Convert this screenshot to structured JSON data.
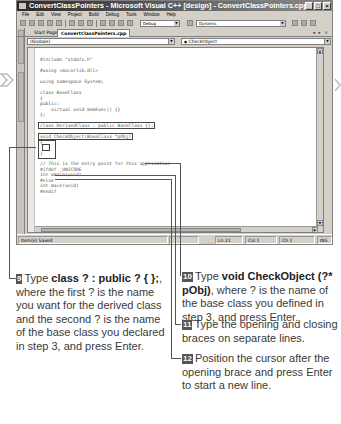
{
  "window": {
    "title": "ConvertClassPointers - Microsoft Visual C++ [design] - ConvertClassPointers.cpp",
    "controls": [
      "minimize",
      "maximize",
      "close"
    ]
  },
  "menubar": {
    "items": [
      "File",
      "Edit",
      "View",
      "Project",
      "Build",
      "Debug",
      "Tools",
      "Window",
      "Help"
    ]
  },
  "toolbar": {
    "config_value": "Debug",
    "find_value": "Dynamic"
  },
  "tabs": {
    "items": [
      {
        "label": "Start Page",
        "active": false
      },
      {
        "label": "ConvertClassPointers.cpp",
        "active": true
      }
    ],
    "controls": "◂ ▸ ×"
  },
  "side_panels": [
    "Server Explorer",
    "Solution Explorer"
  ],
  "navigation": {
    "scope_combo": "(Globals)",
    "member_combo": "CheckObject"
  },
  "code": {
    "lines": [
      {
        "text": "#include \"stdafx.h\"",
        "y": 9
      },
      {
        "text": "#using <mscorlib.dll>",
        "y": 20
      },
      {
        "text": "using namespace System;",
        "y": 31
      },
      {
        "text": "class BaseClass",
        "y": 42
      },
      {
        "text": "{",
        "y": 47.5
      },
      {
        "text": "public:",
        "y": 53
      },
      {
        "text": "    virtual void memFunc() {}",
        "y": 58.5
      },
      {
        "text": "};",
        "y": 64
      },
      {
        "text": "class DerivedClass : public BaseClass {};",
        "y": 75,
        "highlight": true
      },
      {
        "text": "void CheckObject(BaseClass *pObj)",
        "y": 86,
        "highlight": true
      },
      {
        "text": "{",
        "y": 92
      },
      {
        "text": "}",
        "y": 103
      },
      {
        "text": "// This is the entry point for this application",
        "y": 113
      },
      {
        "text": "#ifdef _UNICODE",
        "y": 118.5
      },
      {
        "text": "int wmain(void)",
        "y": 124
      },
      {
        "text": "#else",
        "y": 129.5
      },
      {
        "text": "int main(void)",
        "y": 135
      },
      {
        "text": "#endif",
        "y": 140.5
      }
    ]
  },
  "statusbar": {
    "message": "Item(s) Saved",
    "line": "Ln 21",
    "col": "Col 1",
    "ch": "Ch 1",
    "mode": "INS"
  },
  "steps": [
    {
      "number": "9",
      "parts": [
        {
          "text": "Type ",
          "bold": false
        },
        {
          "text": "class ? : public ? { };",
          "bold": true
        },
        {
          "text": ", where the first ? is the name you want for the derived class and the second ? is the name of the base class you declared in step 3, and press Enter.",
          "bold": false
        }
      ]
    },
    {
      "number": "10",
      "parts": [
        {
          "text": "Type ",
          "bold": false
        },
        {
          "text": "void CheckObject (?* pObj)",
          "bold": true
        },
        {
          "text": ", where ? is the name of the base class you defined in step 3, and press Enter.",
          "bold": false
        }
      ]
    },
    {
      "number": "11",
      "parts": [
        {
          "text": "Type the opening and closing braces on separate lines.",
          "bold": false
        }
      ]
    },
    {
      "number": "12",
      "parts": [
        {
          "text": "Position the cursor after the opening brace and press Enter to start a new line.",
          "bold": false
        }
      ]
    }
  ],
  "colors": {
    "window_chrome": "#d4d0c8",
    "titlebar_dark": "#2a2a2a",
    "step_badge": "#555555",
    "body_text": "#3a3a3a"
  }
}
